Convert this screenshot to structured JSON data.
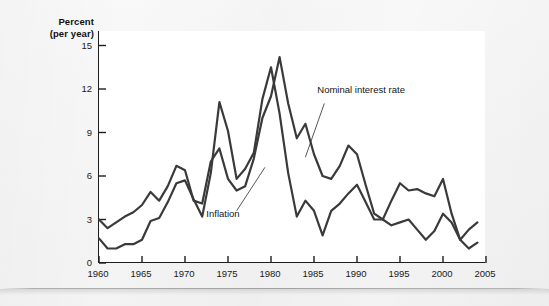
{
  "figure": {
    "y_axis_title_line1": "Percent",
    "y_axis_title_line2": "(per year)"
  },
  "annotations": {
    "nominal_label": "Nominal interest rate",
    "inflation_label": "Inflation"
  },
  "chart_data": {
    "type": "line",
    "title": "",
    "subtitle": "",
    "xlabel": "",
    "ylabel": "Percent (per year)",
    "xlim": [
      1960,
      2005
    ],
    "ylim": [
      0,
      16
    ],
    "grid": false,
    "legend_position": "inline-annotation",
    "xticks": [
      1960,
      1965,
      1970,
      1975,
      1980,
      1985,
      1990,
      1995,
      2000,
      2005
    ],
    "xtick_labels": [
      "1960",
      "1965",
      "1970",
      "1975",
      "1980",
      "1985",
      "1990",
      "1995",
      "2000",
      "2005"
    ],
    "yticks": [
      0,
      3,
      6,
      9,
      12,
      15
    ],
    "ytick_labels": [
      "0",
      "3",
      "6",
      "9",
      "12",
      "15"
    ],
    "x": [
      1960,
      1961,
      1962,
      1963,
      1964,
      1965,
      1966,
      1967,
      1968,
      1969,
      1970,
      1971,
      1972,
      1973,
      1974,
      1975,
      1976,
      1977,
      1978,
      1979,
      1980,
      1981,
      1982,
      1983,
      1984,
      1985,
      1986,
      1987,
      1988,
      1989,
      1990,
      1991,
      1992,
      1993,
      1994,
      1995,
      1996,
      1997,
      1998,
      1999,
      2000,
      2001,
      2002,
      2003,
      2004
    ],
    "series": [
      {
        "name": "Nominal interest rate",
        "color": "#3a3a3a",
        "values": [
          3.0,
          2.4,
          2.8,
          3.2,
          3.5,
          4.0,
          4.9,
          4.3,
          5.3,
          6.7,
          6.4,
          4.3,
          4.1,
          7.0,
          7.9,
          5.8,
          5.0,
          5.3,
          7.2,
          10.0,
          11.5,
          14.2,
          11.0,
          8.6,
          9.6,
          7.5,
          6.0,
          5.8,
          6.7,
          8.1,
          7.5,
          5.4,
          3.4,
          3.0,
          4.3,
          5.5,
          5.0,
          5.1,
          4.8,
          4.6,
          5.8,
          3.4,
          1.6,
          1.0,
          1.4
        ]
      },
      {
        "name": "Inflation",
        "color": "#3a3a3a",
        "values": [
          1.7,
          1.0,
          1.0,
          1.3,
          1.3,
          1.6,
          2.9,
          3.1,
          4.2,
          5.5,
          5.7,
          4.4,
          3.2,
          6.2,
          11.1,
          9.1,
          5.8,
          6.5,
          7.6,
          11.3,
          13.5,
          10.3,
          6.2,
          3.2,
          4.3,
          3.6,
          1.9,
          3.6,
          4.1,
          4.8,
          5.4,
          4.2,
          3.0,
          3.0,
          2.6,
          2.8,
          3.0,
          2.3,
          1.6,
          2.2,
          3.4,
          2.8,
          1.6,
          2.3,
          2.8
        ]
      }
    ]
  }
}
